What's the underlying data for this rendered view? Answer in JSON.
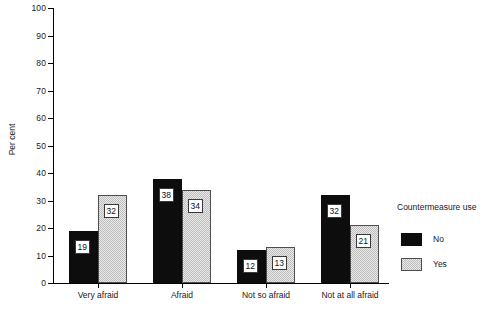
{
  "chart_data": {
    "type": "bar",
    "title": "",
    "xlabel": "",
    "ylabel": "Per cent",
    "ylim": [
      0,
      100
    ],
    "yticks": [
      0,
      10,
      20,
      30,
      40,
      50,
      60,
      70,
      80,
      90,
      100
    ],
    "ytick_labels": [
      "0",
      "10",
      "20",
      "30",
      "40",
      "50",
      "60",
      "70",
      "80",
      "90",
      "100"
    ],
    "grid": false,
    "legend_position": "right",
    "legend_title": "Countermeasure use",
    "categories": [
      "Very afraid",
      "Afraid",
      "Not so afraid",
      "Not at all afraid"
    ],
    "series": [
      {
        "name": "No",
        "color": "#0d0d0d",
        "values": [
          19,
          38,
          12,
          32
        ]
      },
      {
        "name": "Yes",
        "color": "#d3d3d3",
        "values": [
          32,
          34,
          13,
          21
        ]
      }
    ]
  },
  "axes": {
    "y_title": "Per cent"
  },
  "legend": {
    "title": "Countermeasure use",
    "entries": [
      {
        "label": "No",
        "swatch": "solid-black-swatch"
      },
      {
        "label": "Yes",
        "swatch": "hatched-gray-swatch"
      }
    ]
  },
  "caption": {
    "text": ""
  }
}
